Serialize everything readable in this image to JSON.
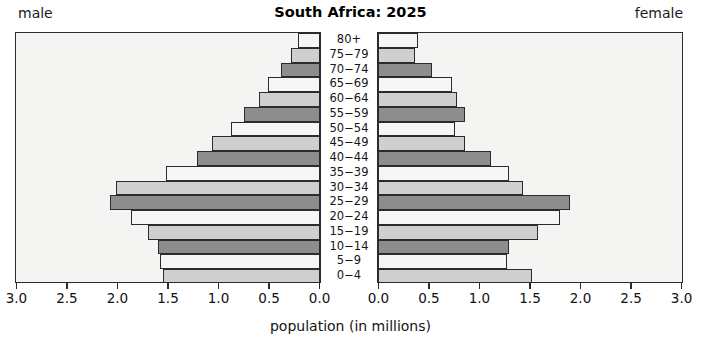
{
  "header": {
    "title": "South Africa: 2025",
    "male_label": "male",
    "female_label": "female"
  },
  "axis": {
    "title": "population (in millions)",
    "tick_labels_left": [
      "3.0",
      "2.5",
      "2.0",
      "1.5",
      "1.0",
      "0.5",
      "0.0"
    ],
    "tick_labels_right": [
      "0.0",
      "0.5",
      "1.0",
      "1.5",
      "2.0",
      "2.5",
      "3.0"
    ],
    "tick_values": [
      3.0,
      2.5,
      2.0,
      1.5,
      1.0,
      0.5,
      0.0
    ],
    "max": 3.0,
    "min": 0.0
  },
  "colors": {
    "fill_light": "#f6f6f4",
    "fill_mid": "#cfcfcd",
    "fill_dark": "#8d8d8b",
    "outline": "#2b2b2b",
    "plot_background": "#f4f4f2",
    "page_background": "#ffffff",
    "text": "#141414"
  },
  "chart_data": {
    "type": "bar",
    "title": "South Africa: 2025",
    "xlabel": "population (in millions)",
    "ylabel": "",
    "xlim": [
      -3.0,
      3.0
    ],
    "grid": false,
    "legend_position": "none",
    "orientation": "horizontal",
    "subtype": "population-pyramid",
    "categories": [
      "80+",
      "75−79",
      "70−74",
      "65−69",
      "60−64",
      "55−59",
      "50−54",
      "45−49",
      "40−44",
      "35−39",
      "30−34",
      "25−29",
      "20−24",
      "15−19",
      "10−14",
      "5−9",
      "0−4"
    ],
    "series": [
      {
        "name": "male",
        "side": "left",
        "values": [
          0.22,
          0.29,
          0.39,
          0.51,
          0.6,
          0.75,
          0.88,
          1.07,
          1.22,
          1.52,
          2.02,
          2.08,
          1.87,
          1.7,
          1.6,
          1.58,
          1.55
        ]
      },
      {
        "name": "female",
        "side": "right",
        "values": [
          0.4,
          0.37,
          0.53,
          0.73,
          0.78,
          0.86,
          0.76,
          0.86,
          1.12,
          1.3,
          1.43,
          1.9,
          1.8,
          1.58,
          1.3,
          1.28,
          1.52
        ]
      }
    ]
  }
}
